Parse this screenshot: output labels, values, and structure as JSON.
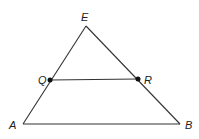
{
  "diagram": {
    "type": "geometry-triangle",
    "points": {
      "E": {
        "label": "E",
        "x": 86,
        "y": 26
      },
      "A": {
        "label": "A",
        "x": 23,
        "y": 124
      },
      "B": {
        "label": "B",
        "x": 180,
        "y": 124
      },
      "Q": {
        "label": "Q",
        "x": 50,
        "y": 80
      },
      "R": {
        "label": "R",
        "x": 138,
        "y": 79
      }
    },
    "segments": [
      [
        "E",
        "A"
      ],
      [
        "E",
        "B"
      ],
      [
        "A",
        "B"
      ],
      [
        "Q",
        "R"
      ]
    ],
    "marked_points": [
      "Q",
      "R"
    ],
    "colors": {
      "line": "#333333",
      "dot": "#111111",
      "background": "#ffffff"
    }
  }
}
